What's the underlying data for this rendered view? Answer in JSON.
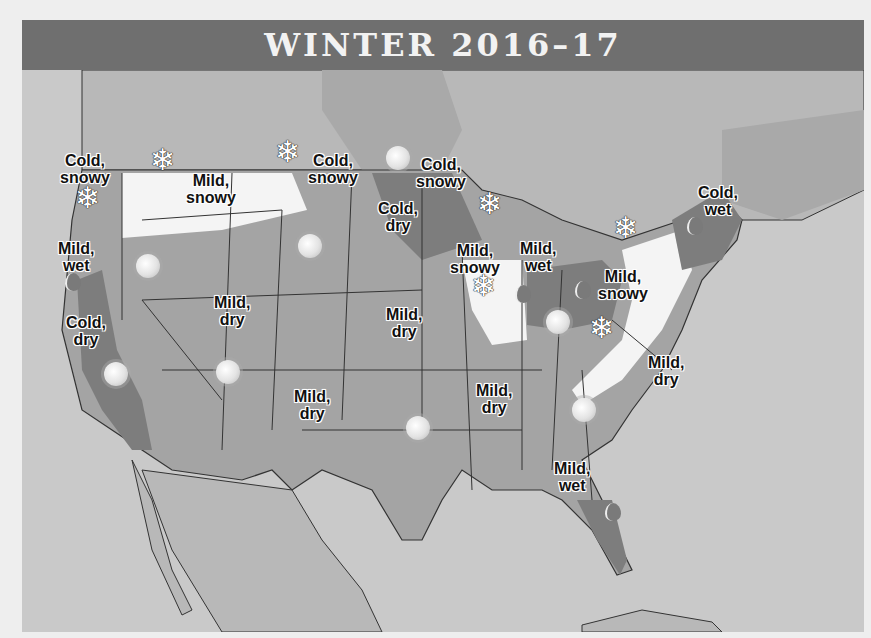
{
  "title": "WINTER 2016–17",
  "colors": {
    "title_bar": "#6f6f6f",
    "background_water": "#c9c9c9",
    "land_other": "#b8b8b8",
    "mild_region": "#a4a4a4",
    "cold_region": "#7d7d7d",
    "snowy_region": "#f4f4f4",
    "border": "#333333"
  },
  "legend_types": {
    "sun-icon": "dry",
    "snowflake-icon": "snowy",
    "raindrop-icon": "wet"
  },
  "regions": [
    {
      "id": "pacific-nw-coast",
      "line1": "Cold,",
      "line2": "snowy",
      "x": 60,
      "y": 152
    },
    {
      "id": "northern-rockies",
      "line1": "Mild,",
      "line2": "snowy",
      "x": 186,
      "y": 172
    },
    {
      "id": "northern-plains",
      "line1": "Cold,",
      "line2": "snowy",
      "x": 308,
      "y": 152
    },
    {
      "id": "upper-midwest",
      "line1": "Cold,",
      "line2": "snowy",
      "x": 416,
      "y": 156
    },
    {
      "id": "north-central",
      "line1": "Cold,",
      "line2": "dry",
      "x": 378,
      "y": 200
    },
    {
      "id": "pacific-nw-inland",
      "line1": "Mild,",
      "line2": "wet",
      "x": 58,
      "y": 240
    },
    {
      "id": "illinois",
      "line1": "Mild,",
      "line2": "snowy",
      "x": 450,
      "y": 242
    },
    {
      "id": "lower-lakes",
      "line1": "Mild,",
      "line2": "wet",
      "x": 520,
      "y": 240
    },
    {
      "id": "northeast",
      "line1": "Cold,",
      "line2": "wet",
      "x": 698,
      "y": 184
    },
    {
      "id": "appalachians",
      "line1": "Mild,",
      "line2": "snowy",
      "x": 598,
      "y": 268
    },
    {
      "id": "california",
      "line1": "Cold,",
      "line2": "dry",
      "x": 66,
      "y": 314
    },
    {
      "id": "intermountain",
      "line1": "Mild,",
      "line2": "dry",
      "x": 214,
      "y": 294
    },
    {
      "id": "great-plains",
      "line1": "Mild,",
      "line2": "dry",
      "x": 386,
      "y": 306
    },
    {
      "id": "southwest",
      "line1": "Mild,",
      "line2": "dry",
      "x": 294,
      "y": 388
    },
    {
      "id": "deep-south",
      "line1": "Mild,",
      "line2": "dry",
      "x": 476,
      "y": 382
    },
    {
      "id": "atlantic-corridor",
      "line1": "Mild,",
      "line2": "dry",
      "x": 648,
      "y": 354
    },
    {
      "id": "florida",
      "line1": "Mild,",
      "line2": "wet",
      "x": 554,
      "y": 460
    }
  ],
  "icons": [
    {
      "type": "snowflake",
      "x": 143,
      "y": 160
    },
    {
      "type": "snowflake",
      "x": 268,
      "y": 152
    },
    {
      "type": "sun",
      "x": 376,
      "y": 158
    },
    {
      "type": "snowflake",
      "x": 68,
      "y": 198
    },
    {
      "type": "snowflake",
      "x": 470,
      "y": 204
    },
    {
      "type": "snowflake",
      "x": 606,
      "y": 228
    },
    {
      "type": "sun",
      "x": 288,
      "y": 246
    },
    {
      "type": "sun",
      "x": 126,
      "y": 266
    },
    {
      "type": "raindrop",
      "x": 50,
      "y": 282
    },
    {
      "type": "snowflake",
      "x": 464,
      "y": 286
    },
    {
      "type": "raindrop",
      "x": 500,
      "y": 294
    },
    {
      "type": "raindrop",
      "x": 560,
      "y": 290
    },
    {
      "type": "sun",
      "x": 536,
      "y": 322
    },
    {
      "type": "snowflake",
      "x": 582,
      "y": 328
    },
    {
      "type": "raindrop",
      "x": 672,
      "y": 226
    },
    {
      "type": "sun",
      "x": 94,
      "y": 374
    },
    {
      "type": "sun",
      "x": 206,
      "y": 372
    },
    {
      "type": "sun",
      "x": 396,
      "y": 428
    },
    {
      "type": "sun",
      "x": 562,
      "y": 410
    },
    {
      "type": "raindrop",
      "x": 590,
      "y": 512
    }
  ]
}
